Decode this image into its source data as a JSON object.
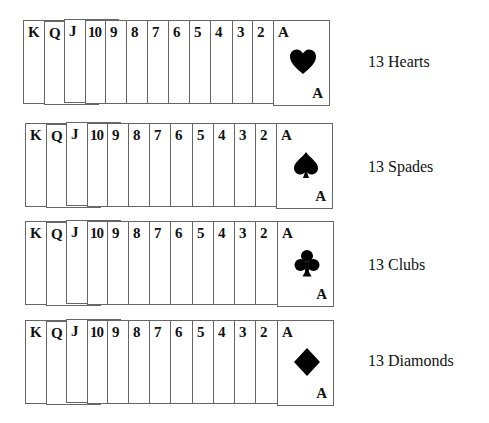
{
  "ranks": [
    "K",
    "Q",
    "J",
    "10",
    "9",
    "8",
    "7",
    "6",
    "5",
    "4",
    "3",
    "2",
    "A"
  ],
  "rows": [
    {
      "suit": "hearts",
      "icon": "heart-icon",
      "label": "13 Hearts",
      "ace_rank": "A",
      "ace_corner": "A"
    },
    {
      "suit": "spades",
      "icon": "spade-icon",
      "label": "13 Spades",
      "ace_rank": "A",
      "ace_corner": "A"
    },
    {
      "suit": "clubs",
      "icon": "club-icon",
      "label": "13 Clubs",
      "ace_rank": "A",
      "ace_corner": "A"
    },
    {
      "suit": "diamonds",
      "icon": "diamond-icon",
      "label": "13 Diamonds",
      "ace_rank": "A",
      "ace_corner": "A"
    }
  ],
  "colors": {
    "card_border": "#666666",
    "ink": "#111111",
    "background": "#ffffff"
  }
}
